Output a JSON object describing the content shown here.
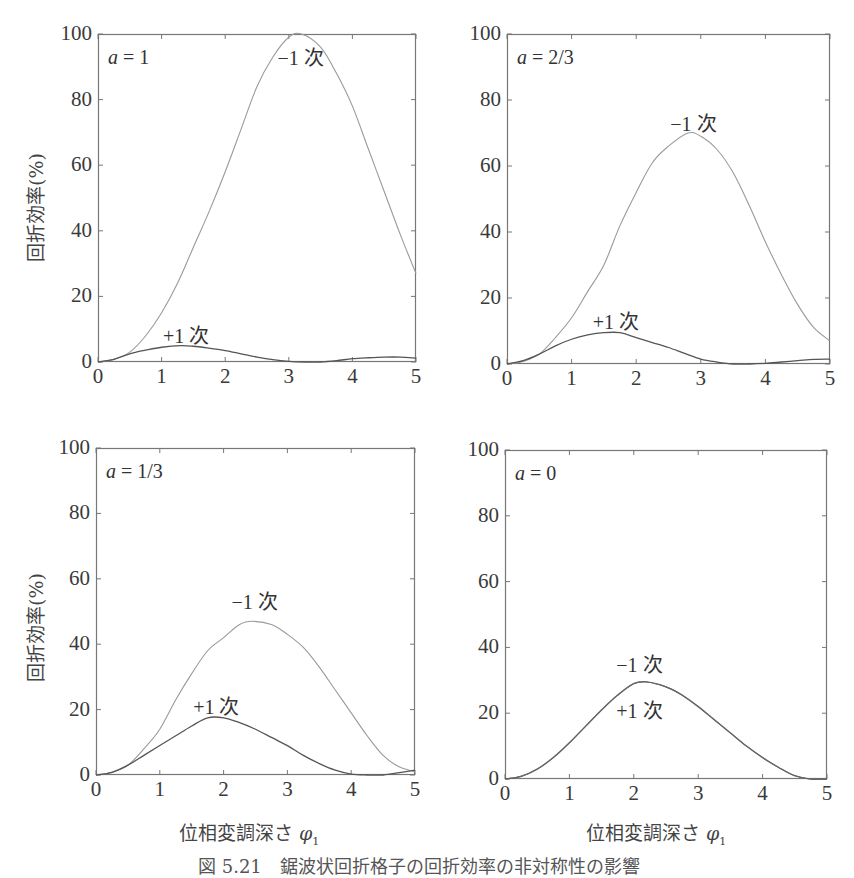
{
  "figure": {
    "caption": "図 5.21　鋸波状回折格子の回折効率の非対称性の影響",
    "ylabel": "回折効率(%)",
    "xlabel_text": "位相変調深さ ",
    "xlabel_symbol": "φ",
    "xlabel_sub": "1"
  },
  "chart_data": [
    {
      "type": "line",
      "title": "a = 1",
      "param_var": "a",
      "param_value": "1",
      "xlabel": "位相変調深さ φ1",
      "ylabel": "回折効率(%)",
      "xlim": [
        0,
        5
      ],
      "ylim": [
        0,
        100
      ],
      "xticks": [
        0,
        1,
        2,
        3,
        4,
        5
      ],
      "yticks": [
        0,
        20,
        40,
        60,
        80,
        100
      ],
      "grid": false,
      "series": [
        {
          "name": "-1 次",
          "color": "#9a9a9a",
          "x": [
            0,
            0.25,
            0.5,
            0.75,
            1,
            1.25,
            1.5,
            1.75,
            2,
            2.25,
            2.5,
            2.75,
            3,
            3.2,
            3.5,
            3.75,
            4,
            4.25,
            4.5,
            4.75,
            5
          ],
          "y": [
            0,
            0.8,
            3,
            8,
            15,
            24,
            35,
            46,
            58,
            71,
            84,
            93,
            99,
            100,
            96,
            88,
            78,
            65,
            52,
            39,
            27
          ]
        },
        {
          "name": "+1 次",
          "color": "#555555",
          "x": [
            0,
            0.25,
            0.5,
            0.75,
            1,
            1.3,
            1.5,
            1.75,
            2,
            2.25,
            2.5,
            2.75,
            3,
            3.25,
            3.5,
            3.75,
            4,
            4.25,
            4.5,
            4.75,
            5
          ],
          "y": [
            0,
            0.8,
            2.5,
            3.6,
            4.5,
            5,
            4.8,
            4.2,
            3.5,
            2.5,
            1.5,
            0.7,
            0.2,
            0,
            0,
            0.4,
            1,
            1.3,
            1.5,
            1.5,
            1.2
          ]
        }
      ],
      "annotations": [
        {
          "text": "−1 次",
          "x": 3.2,
          "y": 94
        },
        {
          "text": "+1 次",
          "x": 1.4,
          "y": 9
        }
      ]
    },
    {
      "type": "line",
      "title": "a = 2/3",
      "param_var": "a",
      "param_value": "2/3",
      "xlabel": "",
      "ylabel": "",
      "xlim": [
        0,
        5
      ],
      "ylim": [
        0,
        100
      ],
      "xticks": [
        0,
        1,
        2,
        3,
        4,
        5
      ],
      "yticks": [
        0,
        20,
        40,
        60,
        80,
        100
      ],
      "grid": false,
      "series": [
        {
          "name": "-1 次",
          "color": "#9a9a9a",
          "x": [
            0,
            0.25,
            0.5,
            0.75,
            1,
            1.25,
            1.5,
            1.75,
            2,
            2.25,
            2.5,
            2.8,
            3,
            3.25,
            3.5,
            3.75,
            4,
            4.25,
            4.5,
            4.75,
            5
          ],
          "y": [
            0,
            0.8,
            3,
            8,
            14,
            22,
            30,
            42,
            52,
            61,
            66,
            70,
            69,
            65,
            58,
            48,
            37,
            27,
            18,
            11,
            7
          ]
        },
        {
          "name": "+1 次",
          "color": "#555555",
          "x": [
            0,
            0.25,
            0.5,
            0.75,
            1,
            1.25,
            1.5,
            1.75,
            2,
            2.25,
            2.5,
            2.75,
            3,
            3.25,
            3.5,
            3.75,
            4,
            4.25,
            4.5,
            4.75,
            5
          ],
          "y": [
            0,
            1,
            3,
            5.5,
            7.5,
            8.8,
            9.5,
            9.5,
            8,
            6.5,
            5,
            3.2,
            1.5,
            0.6,
            0,
            0,
            0.2,
            0.6,
            1,
            1.4,
            1.5
          ]
        }
      ],
      "annotations": [
        {
          "text": "−1 次",
          "x": 2.9,
          "y": 74
        },
        {
          "text": "+1 次",
          "x": 1.7,
          "y": 14
        }
      ]
    },
    {
      "type": "line",
      "title": "a = 1/3",
      "param_var": "a",
      "param_value": "1/3",
      "xlabel": "位相変調深さ φ1",
      "ylabel": "回折効率(%)",
      "xlim": [
        0,
        5
      ],
      "ylim": [
        0,
        100
      ],
      "xticks": [
        0,
        1,
        2,
        3,
        4,
        5
      ],
      "yticks": [
        0,
        20,
        40,
        60,
        80,
        100
      ],
      "grid": false,
      "series": [
        {
          "name": "-1 次",
          "color": "#9a9a9a",
          "x": [
            0,
            0.25,
            0.5,
            0.75,
            1,
            1.25,
            1.5,
            1.75,
            2,
            2.25,
            2.45,
            2.75,
            3,
            3.25,
            3.5,
            3.75,
            4,
            4.25,
            4.5,
            4.75,
            5
          ],
          "y": [
            0,
            0.8,
            3,
            8,
            14,
            23,
            31,
            38,
            42,
            46,
            47,
            46,
            43,
            39,
            33,
            26,
            19,
            12,
            6,
            2.5,
            1
          ]
        },
        {
          "name": "+1 次",
          "color": "#555555",
          "x": [
            0,
            0.25,
            0.5,
            0.75,
            1,
            1.25,
            1.5,
            1.75,
            2,
            2.25,
            2.5,
            2.75,
            3,
            3.25,
            3.5,
            3.75,
            4,
            4.25,
            4.5,
            4.75,
            5
          ],
          "y": [
            0,
            0.8,
            3,
            6,
            9,
            12,
            15,
            17.5,
            17.5,
            16,
            14,
            11.5,
            9,
            6,
            3.5,
            1.5,
            0.3,
            0,
            0,
            0.7,
            1.5
          ]
        }
      ],
      "annotations": [
        {
          "text": "−1 次",
          "x": 2.5,
          "y": 54
        },
        {
          "text": "+1 次",
          "x": 1.9,
          "y": 22
        }
      ]
    },
    {
      "type": "line",
      "title": "a = 0",
      "param_var": "a",
      "param_value": "0",
      "xlabel": "位相変調深さ φ1",
      "ylabel": "",
      "xlim": [
        0,
        5
      ],
      "ylim": [
        0,
        100
      ],
      "xticks": [
        0,
        1,
        2,
        3,
        4,
        5
      ],
      "yticks": [
        0,
        20,
        40,
        60,
        80,
        100
      ],
      "grid": false,
      "series": [
        {
          "name": "-1 次",
          "color": "#666666",
          "x": [
            0,
            0.25,
            0.5,
            0.75,
            1,
            1.25,
            1.5,
            1.75,
            2,
            2.2,
            2.5,
            2.75,
            3,
            3.25,
            3.5,
            3.75,
            4,
            4.25,
            4.5,
            4.75,
            5
          ],
          "y": [
            0,
            0.8,
            3,
            6.5,
            11,
            16,
            21,
            25.5,
            29,
            29.5,
            28,
            25.5,
            22,
            18,
            14,
            10,
            6.5,
            3.5,
            1,
            0,
            0
          ]
        },
        {
          "name": "+1 次",
          "color": "#666666",
          "x": [
            0,
            0.25,
            0.5,
            0.75,
            1,
            1.25,
            1.5,
            1.75,
            2,
            2.2,
            2.5,
            2.75,
            3,
            3.25,
            3.5,
            3.75,
            4,
            4.25,
            4.5,
            4.75,
            5
          ],
          "y": [
            0,
            0.8,
            3,
            6.5,
            11,
            16,
            21,
            25.5,
            29,
            29.5,
            28,
            25.5,
            22,
            18,
            14,
            10,
            6.5,
            3.5,
            1,
            0,
            0
          ]
        }
      ],
      "annotations": [
        {
          "text": "−1 次",
          "x": 2.1,
          "y": 36
        },
        {
          "text": "+1 次",
          "x": 2.1,
          "y": 22
        }
      ]
    }
  ]
}
